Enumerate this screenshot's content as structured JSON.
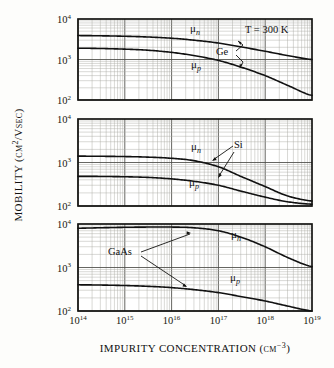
{
  "figure": {
    "axis_titles": {
      "x": "IMPURITY CONCENTRATION (cm",
      "x_exponent": "−3",
      "x_close": ")",
      "y": "MOBILITY (cm",
      "y_exponent": "2",
      "y_rest": "/Vsec)"
    },
    "annotations": {
      "temperature": "T = 300 K"
    },
    "x_ticks": [
      {
        "mantissa": "10",
        "exponent": "14"
      },
      {
        "mantissa": "10",
        "exponent": "15"
      },
      {
        "mantissa": "10",
        "exponent": "16"
      },
      {
        "mantissa": "10",
        "exponent": "17"
      },
      {
        "mantissa": "10",
        "exponent": "18"
      },
      {
        "mantissa": "10",
        "exponent": "19"
      }
    ],
    "y_ticks": [
      {
        "mantissa": "10",
        "exponent": "4"
      },
      {
        "mantissa": "10",
        "exponent": "3"
      },
      {
        "mantissa": "10",
        "exponent": "2"
      }
    ],
    "panels": [
      {
        "material": "Ge",
        "electron_label": "μ",
        "electron_sub": "n",
        "hole_label": "μ",
        "hole_sub": "p"
      },
      {
        "material": "Si",
        "electron_label": "μ",
        "electron_sub": "n",
        "hole_label": "μ",
        "hole_sub": "p"
      },
      {
        "material": "GaAs",
        "electron_label": "μ",
        "electron_sub": "n",
        "hole_label": "μ",
        "hole_sub": "p"
      }
    ]
  },
  "chart_data": {
    "type": "line",
    "title": "",
    "subtitle": "",
    "xlabel": "Impurity concentration (cm^-3)",
    "ylabel": "Mobility (cm^2/Vsec)",
    "xscale": "log",
    "yscale": "log",
    "xlim": [
      100000000000000.0,
      1e+19
    ],
    "ylim": [
      100,
      10000
    ],
    "grid": "log-minor-both-axes",
    "legend_position": "inline-annotations",
    "annotations": [
      "T = 300 K"
    ],
    "panels": [
      {
        "material": "Ge",
        "series": [
          {
            "name": "μ_n",
            "x": [
              100000000000000.0,
              300000000000000.0,
              1000000000000000.0,
              3000000000000000.0,
              1e+16,
              3e+16,
              1e+17,
              3e+17,
              1e+18,
              3e+18,
              1e+19
            ],
            "values": [
              3900,
              3850,
              3750,
              3600,
              3350,
              3000,
              2550,
              2050,
              1600,
              1250,
              1000
            ]
          },
          {
            "name": "μ_p",
            "x": [
              100000000000000.0,
              300000000000000.0,
              1000000000000000.0,
              3000000000000000.0,
              1e+16,
              3e+16,
              1e+17,
              3e+17,
              1e+18,
              3e+18,
              1e+19
            ],
            "values": [
              1900,
              1870,
              1800,
              1700,
              1500,
              1250,
              950,
              650,
              400,
              230,
              130
            ]
          }
        ]
      },
      {
        "material": "Si",
        "series": [
          {
            "name": "μ_n",
            "x": [
              100000000000000.0,
              300000000000000.0,
              1000000000000000.0,
              3000000000000000.0,
              1e+16,
              3e+16,
              1e+17,
              3e+17,
              1e+18,
              3e+18,
              1e+19
            ],
            "values": [
              1400,
              1390,
              1370,
              1330,
              1250,
              1100,
              800,
              480,
              280,
              170,
              130
            ]
          },
          {
            "name": "μ_p",
            "x": [
              100000000000000.0,
              300000000000000.0,
              1000000000000000.0,
              3000000000000000.0,
              1e+16,
              3e+16,
              1e+17,
              3e+17,
              1e+18,
              3e+18,
              1e+19
            ],
            "values": [
              480,
              478,
              470,
              455,
              420,
              370,
              300,
              220,
              160,
              125,
              110
            ]
          }
        ]
      },
      {
        "material": "GaAs",
        "series": [
          {
            "name": "μ_n",
            "x": [
              100000000000000.0,
              300000000000000.0,
              1000000000000000.0,
              3000000000000000.0,
              1e+16,
              3e+16,
              1e+17,
              3e+17,
              1e+18,
              3e+18,
              1e+19
            ],
            "values": [
              8000,
              8200,
              8400,
              8500,
              8500,
              8200,
              7000,
              5000,
              3000,
              1700,
              1050
            ]
          },
          {
            "name": "μ_p",
            "x": [
              100000000000000.0,
              300000000000000.0,
              1000000000000000.0,
              3000000000000000.0,
              1e+16,
              3e+16,
              1e+17,
              3e+17,
              1e+18,
              3e+18,
              1e+19
            ],
            "values": [
              400,
              395,
              385,
              370,
              345,
              310,
              265,
              215,
              170,
              130,
              100
            ]
          }
        ]
      }
    ]
  }
}
